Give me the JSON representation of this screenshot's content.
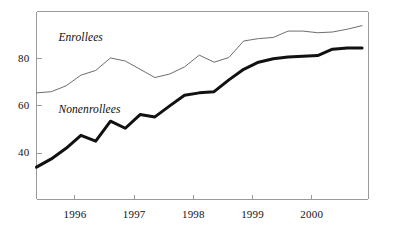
{
  "chart_data": {
    "type": "line",
    "title": "",
    "subtitle": "",
    "xlabel": "",
    "ylabel": "",
    "xlim": [
      1995.35,
      2000.95
    ],
    "ylim": [
      20.5,
      100.0
    ],
    "grid": false,
    "legend_position": "inline-annotation",
    "yticks": [
      40,
      60,
      80
    ],
    "ytick_labels": [
      "40",
      "60",
      "80"
    ],
    "xticks": [
      1996,
      1997,
      1998,
      1999,
      2000
    ],
    "xtick_labels": [
      "1996",
      "1997",
      "1998",
      "1999",
      "2000"
    ],
    "annotations": [
      {
        "text": "Enrollees",
        "x": 1995.72,
        "y": 88.5
      },
      {
        "text": "Nonenrollees",
        "x": 1995.72,
        "y": 58.0
      }
    ],
    "series": [
      {
        "name": "Enrollees",
        "color": "#6e6e6e",
        "line_width": 1,
        "x": [
          1995.35,
          1995.6,
          1995.85,
          1996.1,
          1996.35,
          1996.6,
          1996.85,
          1997.1,
          1997.35,
          1997.6,
          1997.85,
          1998.1,
          1998.35,
          1998.6,
          1998.85,
          1999.1,
          1999.35,
          1999.6,
          1999.85,
          2000.1,
          2000.35,
          2000.6,
          2000.85
        ],
        "values": [
          65.5,
          66.0,
          68.5,
          73.0,
          75.0,
          80.3,
          79.0,
          75.5,
          72.0,
          73.5,
          76.5,
          81.5,
          78.5,
          80.5,
          87.5,
          88.5,
          89.0,
          91.7,
          91.7,
          91.0,
          91.3,
          92.5,
          94.0
        ]
      },
      {
        "name": "Nonenrollees",
        "color": "#111111",
        "line_width": 3,
        "x": [
          1995.35,
          1995.6,
          1995.85,
          1996.1,
          1996.35,
          1996.6,
          1996.85,
          1997.1,
          1997.35,
          1997.6,
          1997.85,
          1998.1,
          1998.35,
          1998.6,
          1998.85,
          1999.1,
          1999.35,
          1999.6,
          1999.85,
          2000.1,
          2000.35,
          2000.6,
          2000.85
        ],
        "values": [
          34.0,
          37.5,
          42.0,
          47.5,
          45.0,
          53.5,
          50.5,
          56.3,
          55.3,
          60.0,
          64.5,
          65.5,
          66.0,
          71.0,
          75.5,
          78.5,
          80.0,
          80.7,
          81.0,
          81.3,
          84.0,
          84.5,
          84.5
        ]
      }
    ]
  },
  "axes": {
    "frame_color": "#9a9a9a",
    "tick_color": "#9a9a9a"
  }
}
